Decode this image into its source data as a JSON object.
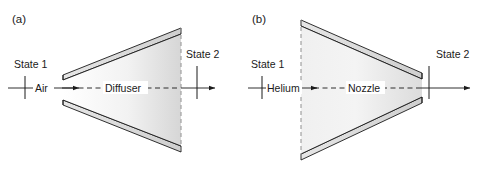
{
  "figure": {
    "background_color": "#ffffff",
    "line_color": "#1a1a1a",
    "fill_light": "#fdfdfd",
    "fill_dark": "#d8d8d8",
    "wall_fill": "#e8e8e8"
  },
  "panels": [
    {
      "id": "panel-a",
      "tag": "(a)",
      "device_label": "Diffuser",
      "fluid_label": "Air",
      "inlet_label": "State 1",
      "outlet_label": "State 2",
      "shape": "diverging-trapezoid"
    },
    {
      "id": "panel-b",
      "tag": "(b)",
      "device_label": "Nozzle",
      "fluid_label": "Helium",
      "inlet_label": "State 1",
      "outlet_label": "State 2",
      "shape": "converging-trapezoid"
    }
  ],
  "icons": {
    "flow_arrow": "arrow-right-icon",
    "centerline": "dashed-centerline-icon",
    "station_tick": "vertical-tick-icon"
  }
}
